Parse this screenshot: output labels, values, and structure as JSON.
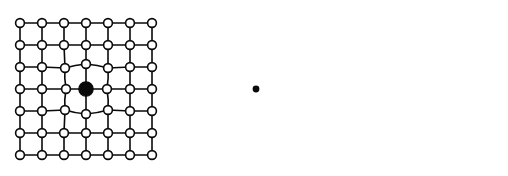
{
  "figure": {
    "background_color": "#ffffff",
    "node_color": "#ffffff",
    "line_color": "#0a0a0a",
    "marker_color": "#0a0a0a",
    "panel_count": 3,
    "grid_rows": 7,
    "grid_cols": 7,
    "node_radius": 4.4,
    "point_radius": 3.4
  },
  "panels": [
    {
      "id": "panel-1",
      "name": "single-coarse-marker-mesh",
      "description": "7 by 7 node mesh with one large filled node at the centre; the four surrounding nodes are drawn inward with curved connecting edges",
      "marker_type": "large-filled-node",
      "marker_count": 1,
      "markers": [
        {
          "x": 86,
          "y": 89,
          "r": 7.2
        }
      ],
      "nodes": [
        [
          20,
          23
        ],
        [
          42,
          23
        ],
        [
          64,
          23
        ],
        [
          86,
          23
        ],
        [
          108,
          23
        ],
        [
          130,
          23
        ],
        [
          152,
          23
        ],
        [
          20,
          45
        ],
        [
          42,
          45
        ],
        [
          64,
          45
        ],
        [
          86,
          45
        ],
        [
          108,
          45
        ],
        [
          130,
          45
        ],
        [
          152,
          45
        ],
        [
          20,
          67
        ],
        [
          42,
          67
        ],
        [
          65,
          68
        ],
        [
          86,
          64
        ],
        [
          108,
          68
        ],
        [
          130,
          67
        ],
        [
          152,
          67
        ],
        [
          20,
          89
        ],
        [
          42,
          89
        ],
        [
          66,
          89
        ],
        [
          86,
          89
        ],
        [
          107,
          89
        ],
        [
          130,
          89
        ],
        [
          152,
          89
        ],
        [
          20,
          111
        ],
        [
          42,
          111
        ],
        [
          65,
          110
        ],
        [
          86,
          114
        ],
        [
          108,
          110
        ],
        [
          130,
          111
        ],
        [
          152,
          111
        ],
        [
          20,
          133
        ],
        [
          42,
          133
        ],
        [
          64,
          133
        ],
        [
          86,
          133
        ],
        [
          108,
          133
        ],
        [
          130,
          133
        ],
        [
          152,
          133
        ],
        [
          20,
          155
        ],
        [
          42,
          155
        ],
        [
          64,
          155
        ],
        [
          86,
          155
        ],
        [
          108,
          155
        ],
        [
          130,
          155
        ],
        [
          152,
          155
        ]
      ]
    },
    {
      "id": "panel-2",
      "name": "single-fine-point-mesh",
      "description": "7 by 7 node mesh with a small filled point at the centre; the eight neighbouring nodes are pulled toward the point forming a diamond of curved edges",
      "marker_type": "small-filled-point",
      "marker_count": 1,
      "markers": [
        {
          "x": 256,
          "y": 89,
          "r": 3.4
        }
      ],
      "nodes": [
        [
          20,
          23
        ],
        [
          42,
          23
        ],
        [
          64,
          23
        ],
        [
          86,
          23
        ],
        [
          108,
          23
        ],
        [
          130,
          23
        ],
        [
          152,
          23
        ],
        [
          20,
          45
        ],
        [
          42,
          45
        ],
        [
          64,
          45
        ],
        [
          86,
          45
        ],
        [
          108,
          45
        ],
        [
          130,
          45
        ],
        [
          152,
          45
        ],
        [
          20,
          67
        ],
        [
          42,
          67
        ],
        [
          64,
          70
        ],
        [
          86,
          67
        ],
        [
          109,
          70
        ],
        [
          130,
          67
        ],
        [
          152,
          67
        ],
        [
          20,
          89
        ],
        [
          42,
          89
        ],
        [
          62,
          91
        ],
        [
          86,
          89
        ],
        [
          110,
          91
        ],
        [
          130,
          89
        ],
        [
          152,
          89
        ],
        [
          20,
          111
        ],
        [
          42,
          111
        ],
        [
          64,
          108
        ],
        [
          86,
          112
        ],
        [
          109,
          108
        ],
        [
          130,
          111
        ],
        [
          152,
          111
        ],
        [
          20,
          133
        ],
        [
          42,
          133
        ],
        [
          64,
          133
        ],
        [
          86,
          133
        ],
        [
          108,
          133
        ],
        [
          130,
          133
        ],
        [
          152,
          133
        ],
        [
          20,
          155
        ],
        [
          42,
          155
        ],
        [
          64,
          155
        ],
        [
          86,
          155
        ],
        [
          108,
          155
        ],
        [
          130,
          155
        ],
        [
          152,
          155
        ]
      ]
    },
    {
      "id": "panel-3",
      "name": "multi-point-distorted-mesh",
      "description": "Distorted 7 by 7 node mesh containing four small filled points, each enclosed by its own polygonal cell of curved edges",
      "marker_type": "small-filled-point",
      "marker_count": 4,
      "markers": [
        {
          "x": 62,
          "y": 57,
          "r": 3.4
        },
        {
          "x": 117,
          "y": 80,
          "r": 3.4
        },
        {
          "x": 131,
          "y": 48,
          "r": 3.4
        },
        {
          "x": 117,
          "y": 127,
          "r": 3.4
        }
      ],
      "nodes": [
        [
          22,
          23
        ],
        [
          44,
          22
        ],
        [
          66,
          23
        ],
        [
          88,
          23
        ],
        [
          110,
          23
        ],
        [
          131,
          22
        ],
        [
          152,
          23
        ],
        [
          20,
          45
        ],
        [
          46,
          45
        ],
        [
          68,
          45
        ],
        [
          92,
          44
        ],
        [
          112,
          42
        ],
        [
          134,
          43
        ],
        [
          153,
          46
        ],
        [
          20,
          68
        ],
        [
          45,
          66
        ],
        [
          68,
          67
        ],
        [
          90,
          62
        ],
        [
          106,
          60
        ],
        [
          137,
          64
        ],
        [
          153,
          66
        ],
        [
          21,
          89
        ],
        [
          44,
          90
        ],
        [
          66,
          90
        ],
        [
          88,
          83
        ],
        [
          108,
          92
        ],
        [
          132,
          88
        ],
        [
          153,
          88
        ],
        [
          21,
          111
        ],
        [
          44,
          110
        ],
        [
          66,
          110
        ],
        [
          88,
          110
        ],
        [
          110,
          108
        ],
        [
          131,
          112
        ],
        [
          153,
          110
        ],
        [
          21,
          133
        ],
        [
          43,
          133
        ],
        [
          65,
          133
        ],
        [
          87,
          133
        ],
        [
          107,
          134
        ],
        [
          133,
          133
        ],
        [
          153,
          133
        ],
        [
          21,
          155
        ],
        [
          43,
          155
        ],
        [
          65,
          155
        ],
        [
          87,
          155
        ],
        [
          109,
          155
        ],
        [
          131,
          155
        ],
        [
          153,
          155
        ]
      ]
    }
  ]
}
